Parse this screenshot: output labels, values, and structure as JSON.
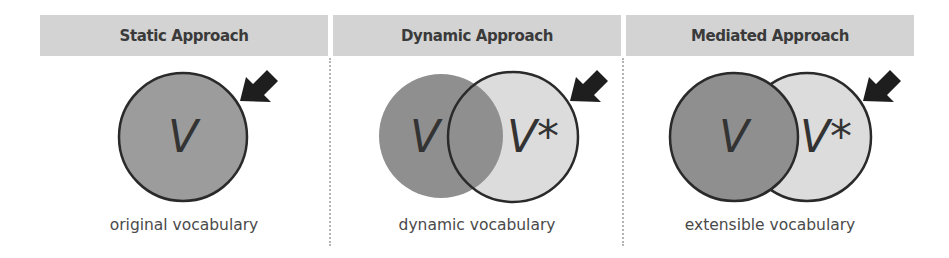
{
  "panels": [
    {
      "id": "static",
      "header": "Static Approach",
      "caption": "original vocabulary",
      "labels": [
        "V"
      ]
    },
    {
      "id": "dynamic",
      "header": "Dynamic Approach",
      "caption": "dynamic vocabulary",
      "labels": [
        "V",
        "V*"
      ]
    },
    {
      "id": "mediated",
      "header": "Mediated Approach",
      "caption": "extensible vocabulary",
      "labels": [
        "V",
        "V*"
      ]
    }
  ],
  "colors": {
    "header_bg": "#d3d3d3",
    "original_fill": "#9c9c9c",
    "dark_fill": "#8f8f8f",
    "light_fill": "#dcdcdc",
    "stroke": "#2a2a2a",
    "arrow": "#1e1e1e",
    "divider": "#b5b5b5"
  }
}
